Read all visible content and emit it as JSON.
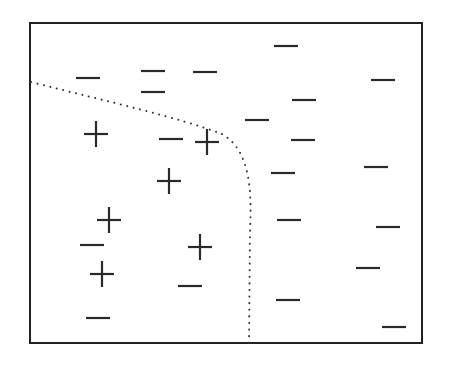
{
  "diagram": {
    "title": "",
    "colors": {
      "frame": "#222222",
      "marks": "#2a2a2a",
      "boundary": "#333333",
      "background": "#ffffff"
    },
    "frame": {
      "x": 30,
      "y": 23,
      "width": 392,
      "height": 320
    },
    "boundary": {
      "style": "dotted",
      "path": "M 31 82 C 110 102, 180 118, 222 134 C 250 150, 252 190, 250 230 L 249 343"
    },
    "positives": [
      {
        "x": 96,
        "y": 134
      },
      {
        "x": 207,
        "y": 142
      },
      {
        "x": 169,
        "y": 181
      },
      {
        "x": 109,
        "y": 220
      },
      {
        "x": 200,
        "y": 247
      },
      {
        "x": 102,
        "y": 274
      }
    ],
    "negatives": [
      {
        "x": 286,
        "y": 46
      },
      {
        "x": 88,
        "y": 78
      },
      {
        "x": 153,
        "y": 71
      },
      {
        "x": 205,
        "y": 72
      },
      {
        "x": 383,
        "y": 80
      },
      {
        "x": 153,
        "y": 92
      },
      {
        "x": 304,
        "y": 100
      },
      {
        "x": 257,
        "y": 120
      },
      {
        "x": 171,
        "y": 139
      },
      {
        "x": 303,
        "y": 140
      },
      {
        "x": 283,
        "y": 173
      },
      {
        "x": 376,
        "y": 167
      },
      {
        "x": 289,
        "y": 220
      },
      {
        "x": 388,
        "y": 227
      },
      {
        "x": 92,
        "y": 245
      },
      {
        "x": 368,
        "y": 268
      },
      {
        "x": 190,
        "y": 286
      },
      {
        "x": 288,
        "y": 300
      },
      {
        "x": 98,
        "y": 318
      },
      {
        "x": 394,
        "y": 327
      }
    ]
  }
}
